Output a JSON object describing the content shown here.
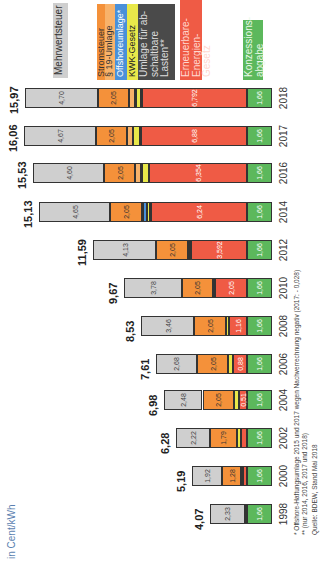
{
  "chart_data": {
    "type": "bar",
    "stacked": true,
    "orientation": "rotated-90-ccw",
    "title": "",
    "ylabel": "in Cent/kWh",
    "xlabel": "",
    "categories": [
      "1998",
      "2000",
      "2002",
      "2004",
      "2006",
      "2008",
      "2010",
      "2012",
      "2014",
      "2016",
      "2017",
      "2018"
    ],
    "totals": [
      "4,07",
      "5,19",
      "6,28",
      "6,98",
      "7,61",
      "8,53",
      "9,67",
      "11,59",
      "15,13",
      "15,53",
      "16,06",
      "15,97"
    ],
    "series": [
      {
        "name": "Konzessionsabgabe",
        "color": "#5cb85c",
        "values": [
          1.66,
          1.66,
          1.66,
          1.66,
          1.66,
          1.66,
          1.66,
          1.66,
          1.66,
          1.66,
          1.66,
          1.66
        ],
        "labels": [
          "1,66",
          "1,66",
          "1,66",
          "1,66",
          "1,66",
          "1,66",
          "1,66",
          "1,66",
          "1,66",
          "1,66",
          "1,66",
          "1,66"
        ]
      },
      {
        "name": "Erneuerbare-Energien-Gesetz",
        "color": "#ef5b45",
        "values": [
          0.08,
          0.2,
          0.35,
          0.51,
          0.88,
          1.16,
          2.05,
          3.592,
          6.24,
          6.354,
          6.88,
          6.792
        ],
        "labels": [
          "0,08",
          "0,20",
          "0,35",
          "0,51",
          "0,88",
          "1,16",
          "2,05",
          "3,592",
          "6,24",
          "6,354",
          "6,88",
          "6,792"
        ]
      },
      {
        "name": "Umlage für abschaltbare Lasten**",
        "color": "#4a4a4a",
        "values": [
          0,
          0,
          0,
          0,
          0,
          0,
          0,
          0,
          0.009,
          0,
          0.006,
          0.011
        ],
        "labels": [
          "",
          "",
          "",
          "",
          "",
          "",
          "",
          "",
          "",
          "",
          "",
          ""
        ]
      },
      {
        "name": "KWK-Gesetz",
        "color": "#e8e84a",
        "values": [
          0,
          0.13,
          0.26,
          0.31,
          0.31,
          0.2,
          0.13,
          0.002,
          0.178,
          0.445,
          0.438,
          0.345
        ],
        "labels": [
          "",
          "0,13",
          "0,26",
          "0,31",
          "0,31",
          "0,2",
          "0,13",
          "0,002",
          "0,178",
          "0,445",
          "0,438",
          "0,345"
        ]
      },
      {
        "name": "Offshoreumlage*",
        "color": "#4a90d9",
        "values": [
          0,
          0,
          0,
          0,
          0,
          0,
          0,
          0,
          0.25,
          0.04,
          -0.028,
          0.037
        ],
        "labels": [
          "",
          "",
          "",
          "",
          "",
          "",
          "",
          "",
          "",
          "0,04",
          "",
          ""
        ]
      },
      {
        "name": "§ 19-Umlage",
        "color": "#f8b26a",
        "values": [
          0,
          0,
          0,
          0,
          0,
          0,
          0,
          0.151,
          0.092,
          0.378,
          0.388,
          0.37
        ],
        "labels": [
          "",
          "",
          "",
          "",
          "",
          "",
          "",
          "0,151",
          "",
          "0,378",
          "0,388",
          "0,37"
        ]
      },
      {
        "name": "Stromsteuer",
        "color": "#f4913a",
        "values": [
          0,
          1.28,
          1.79,
          2.05,
          2.05,
          2.05,
          2.05,
          2.05,
          2.05,
          2.05,
          2.05,
          2.05
        ],
        "labels": [
          "",
          "1,28",
          "1,79",
          "2,05",
          "2,05",
          "2,05",
          "2,05",
          "2,05",
          "2,05",
          "2,05",
          "2,05",
          "2,05"
        ]
      },
      {
        "name": "Mehrwertsteuer",
        "color": "#cfcfcf",
        "values": [
          2.33,
          1.92,
          2.22,
          2.48,
          2.68,
          3.46,
          3.78,
          4.13,
          4.65,
          4.6,
          4.67,
          4.7
        ],
        "labels": [
          "2,33",
          "1,92",
          "2,22",
          "2,48",
          "2,68",
          "3,46",
          "3,78",
          "4,13",
          "4,65",
          "4,60",
          "4,67",
          "4,70"
        ]
      }
    ],
    "ylim": [
      0,
      17
    ],
    "grid": false,
    "legend_position": "right"
  },
  "unit_label": "in Cent/kWh",
  "legend": [
    {
      "label": "Mehrwertsteuer",
      "bg": "#cfcfcf",
      "fg": "#333333"
    },
    {
      "label": "Stromsteuer",
      "bg": "#f4913a",
      "fg": "#333333"
    },
    {
      "label": "§ 19-Umlage",
      "bg": "#f8b26a",
      "fg": "#333333"
    },
    {
      "label": "Offshoreumlage*",
      "bg": "#4a90d9",
      "fg": "#ffffff"
    },
    {
      "label": "KWK-Gesetz",
      "bg": "#e8e84a",
      "fg": "#222222"
    },
    {
      "label": "Umlage für ab-\nschaltbare\nLasten**",
      "bg": "#4a4a4a",
      "fg": "#dddddd"
    },
    {
      "label": "Erneuerbare-\nEnergien-Gesetz",
      "bg": "#ef5b45",
      "fg": "#ffd8d0"
    },
    {
      "label": "Konzessions-\nabgabe",
      "bg": "#5cb85c",
      "fg": "#e8f8e8"
    }
  ],
  "footnotes": [
    "* Offshore-Haftungsumlage 2015 und 2017 wegen Nachverrechnung negativ (2017: - 0,028)",
    "** (nur 2014, 2016, 2017 und 2018)",
    "Quelle: BDEW, Stand Mai 2018"
  ]
}
